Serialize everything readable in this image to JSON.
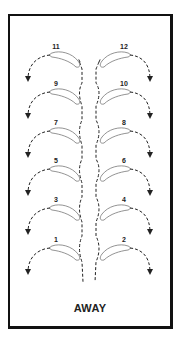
{
  "diagram": {
    "caption": "AWAY",
    "colors": {
      "ink": "#222222",
      "background": "#ffffff"
    },
    "steps": [
      {
        "label": "11",
        "side": "left",
        "y": 47
      },
      {
        "label": "12",
        "side": "right",
        "y": 47
      },
      {
        "label": "9",
        "side": "left",
        "y": 84
      },
      {
        "label": "10",
        "side": "right",
        "y": 84
      },
      {
        "label": "7",
        "side": "left",
        "y": 123
      },
      {
        "label": "8",
        "side": "right",
        "y": 123
      },
      {
        "label": "5",
        "side": "left",
        "y": 161
      },
      {
        "label": "6",
        "side": "right",
        "y": 161
      },
      {
        "label": "3",
        "side": "left",
        "y": 200
      },
      {
        "label": "4",
        "side": "right",
        "y": 200
      },
      {
        "label": "1",
        "side": "left",
        "y": 240
      },
      {
        "label": "2",
        "side": "right",
        "y": 240
      }
    ]
  }
}
